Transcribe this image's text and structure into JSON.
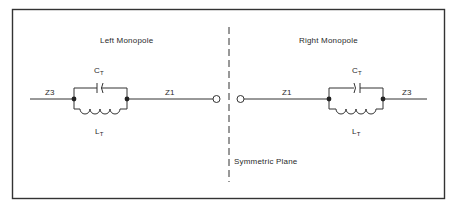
{
  "diagram": {
    "left": {
      "title": "Left Monopole",
      "outer_impedance": "Z3",
      "inner_impedance": "Z1",
      "capacitor": {
        "symbol": "C",
        "subscript": "T"
      },
      "inductor": {
        "symbol": "L",
        "subscript": "T"
      }
    },
    "right": {
      "title": "Right Monopole",
      "outer_impedance": "Z3",
      "inner_impedance": "Z1",
      "capacitor": {
        "symbol": "C",
        "subscript": "T"
      },
      "inductor": {
        "symbol": "L",
        "subscript": "T"
      }
    },
    "symmetry_label": "Symmetric Plane",
    "colors": {
      "line": "#333333",
      "background": "#ffffff"
    }
  }
}
